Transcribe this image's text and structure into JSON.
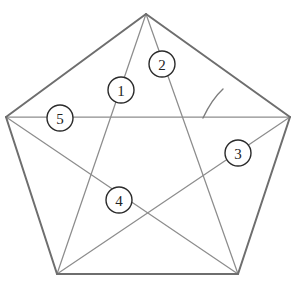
{
  "figure": {
    "kind": "pentagon-with-diagonals",
    "background_color": "#ffffff",
    "edge_color": "#6e6e6e",
    "diagonal_color": "#8d8d8d",
    "label_text_color": "#222222",
    "label_circle_fill": "#ffffff",
    "label_circle_stroke": "#2b2b2b",
    "label_circle_radius": 13,
    "vertices": [
      {
        "name": "top-apex",
        "x": 146,
        "y": 14
      },
      {
        "name": "right-upper",
        "x": 290,
        "y": 117
      },
      {
        "name": "bottom-right",
        "x": 238,
        "y": 274
      },
      {
        "name": "bottom-left",
        "x": 57,
        "y": 274
      },
      {
        "name": "left-upper",
        "x": 6,
        "y": 117
      }
    ],
    "edges": [
      {
        "name": "edge-top-left",
        "from": 0,
        "to": 4
      },
      {
        "name": "edge-top-right",
        "from": 0,
        "to": 1
      },
      {
        "name": "edge-right",
        "from": 1,
        "to": 2
      },
      {
        "name": "edge-bottom",
        "from": 2,
        "to": 3
      },
      {
        "name": "edge-left",
        "from": 3,
        "to": 4
      }
    ],
    "diagonals": [
      {
        "name": "diagonal-apex-to-bottom-left",
        "from": 0,
        "to": 3
      },
      {
        "name": "diagonal-apex-to-bottom-right",
        "from": 0,
        "to": 2
      },
      {
        "name": "diagonal-left-to-right",
        "from": 4,
        "to": 1
      },
      {
        "name": "diagonal-left-to-bottom-right",
        "from": 4,
        "to": 2
      },
      {
        "name": "diagonal-right-to-bottom-left",
        "from": 1,
        "to": 3
      }
    ],
    "angle_arc": {
      "name": "angle-arc-mark",
      "path": "M 203 118 Q 212 99 223 89"
    },
    "labels": [
      {
        "id": "label-1",
        "text": "1",
        "x": 121,
        "y": 90
      },
      {
        "id": "label-2",
        "text": "2",
        "x": 162,
        "y": 64
      },
      {
        "id": "label-3",
        "text": "3",
        "x": 238,
        "y": 153
      },
      {
        "id": "label-4",
        "text": "4",
        "x": 119,
        "y": 200
      },
      {
        "id": "label-5",
        "text": "5",
        "x": 60,
        "y": 118
      }
    ]
  }
}
